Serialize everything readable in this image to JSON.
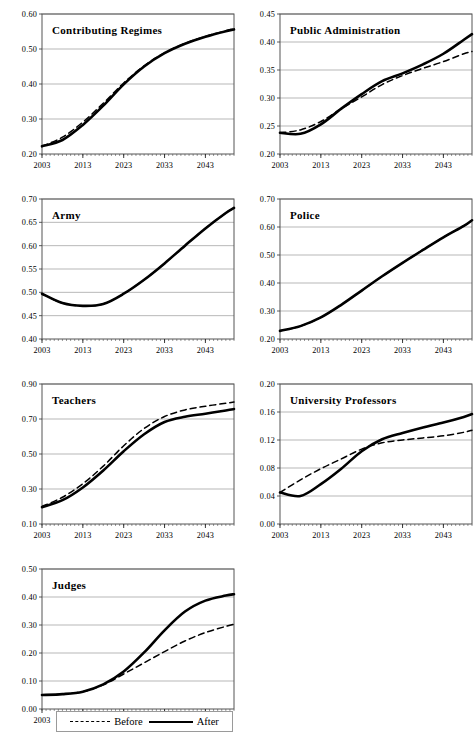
{
  "figure": {
    "xticks": [
      "2003",
      "2013",
      "2023",
      "2033",
      "2043"
    ],
    "x_start": 2003,
    "x_end": 2050
  },
  "legend": {
    "before_label": "Before",
    "after_label": "After",
    "before_style": "dashed",
    "after_style": "solid"
  },
  "chart_data": [
    {
      "type": "line",
      "title": "Contributing Regimes",
      "xlabel": "",
      "ylabel": "",
      "xlim": [
        2003,
        2050
      ],
      "ylim": [
        0.2,
        0.6
      ],
      "yticks": [
        0.2,
        0.3,
        0.4,
        0.5,
        0.6
      ],
      "ytick_labels": [
        "0.20",
        "0.30",
        "0.40",
        "0.50",
        "0.60"
      ],
      "xticks": [
        2003,
        2013,
        2023,
        2033,
        2043
      ],
      "grid": true,
      "legend_position": "figure-bottom",
      "x": [
        2003,
        2008,
        2013,
        2018,
        2023,
        2028,
        2033,
        2038,
        2043,
        2048,
        2050
      ],
      "series": [
        {
          "name": "Before",
          "style": "dashed",
          "values": [
            0.222,
            0.248,
            0.291,
            0.345,
            0.403,
            0.452,
            0.489,
            0.516,
            0.536,
            0.552,
            0.557
          ]
        },
        {
          "name": "After",
          "style": "solid",
          "values": [
            0.222,
            0.24,
            0.283,
            0.338,
            0.399,
            0.45,
            0.488,
            0.515,
            0.535,
            0.551,
            0.556
          ]
        }
      ]
    },
    {
      "type": "line",
      "title": "Public Administration",
      "xlabel": "",
      "ylabel": "",
      "xlim": [
        2003,
        2050
      ],
      "ylim": [
        0.2,
        0.45
      ],
      "yticks": [
        0.2,
        0.25,
        0.3,
        0.35,
        0.4,
        0.45
      ],
      "ytick_labels": [
        "0.20",
        "0.25",
        "0.30",
        "0.35",
        "0.40",
        "0.45"
      ],
      "xticks": [
        2003,
        2013,
        2023,
        2033,
        2043
      ],
      "grid": true,
      "legend_position": "figure-bottom",
      "x": [
        2003,
        2008,
        2013,
        2018,
        2023,
        2028,
        2033,
        2038,
        2043,
        2048,
        2050
      ],
      "series": [
        {
          "name": "Before",
          "style": "dashed",
          "values": [
            0.238,
            0.243,
            0.258,
            0.281,
            0.302,
            0.324,
            0.34,
            0.353,
            0.365,
            0.379,
            0.383
          ]
        },
        {
          "name": "After",
          "style": "solid",
          "values": [
            0.238,
            0.236,
            0.253,
            0.281,
            0.307,
            0.33,
            0.344,
            0.36,
            0.379,
            0.404,
            0.414
          ]
        }
      ]
    },
    {
      "type": "line",
      "title": "Army",
      "xlabel": "",
      "ylabel": "",
      "xlim": [
        2003,
        2050
      ],
      "ylim": [
        0.4,
        0.7
      ],
      "yticks": [
        0.4,
        0.45,
        0.5,
        0.55,
        0.6,
        0.65,
        0.7
      ],
      "ytick_labels": [
        "0.40",
        "0.45",
        "0.50",
        "0.55",
        "0.60",
        "0.65",
        "0.70"
      ],
      "xticks": [
        2003,
        2013,
        2023,
        2033,
        2043
      ],
      "grid": true,
      "legend_position": "figure-bottom",
      "x": [
        2003,
        2008,
        2013,
        2018,
        2023,
        2028,
        2033,
        2038,
        2043,
        2048,
        2050
      ],
      "series": [
        {
          "name": "Before",
          "style": "dashed",
          "values": [
            0.497,
            0.477,
            0.471,
            0.475,
            0.497,
            0.527,
            0.562,
            0.6,
            0.637,
            0.67,
            0.681
          ]
        },
        {
          "name": "After",
          "style": "solid",
          "values": [
            0.497,
            0.477,
            0.471,
            0.475,
            0.497,
            0.527,
            0.562,
            0.6,
            0.637,
            0.67,
            0.681
          ]
        }
      ]
    },
    {
      "type": "line",
      "title": "Police",
      "xlabel": "",
      "ylabel": "",
      "xlim": [
        2003,
        2050
      ],
      "ylim": [
        0.2,
        0.7
      ],
      "yticks": [
        0.2,
        0.3,
        0.4,
        0.5,
        0.6,
        0.7
      ],
      "ytick_labels": [
        "0.20",
        "0.30",
        "0.40",
        "0.50",
        "0.60",
        "0.70"
      ],
      "xticks": [
        2003,
        2013,
        2023,
        2033,
        2043
      ],
      "grid": true,
      "legend_position": "figure-bottom",
      "x": [
        2003,
        2008,
        2013,
        2018,
        2023,
        2028,
        2033,
        2038,
        2043,
        2048,
        2050
      ],
      "series": [
        {
          "name": "Before",
          "style": "dashed",
          "values": [
            0.229,
            0.246,
            0.277,
            0.322,
            0.373,
            0.424,
            0.472,
            0.518,
            0.563,
            0.604,
            0.624
          ]
        },
        {
          "name": "After",
          "style": "solid",
          "values": [
            0.229,
            0.246,
            0.277,
            0.322,
            0.373,
            0.424,
            0.472,
            0.518,
            0.563,
            0.604,
            0.624
          ]
        }
      ]
    },
    {
      "type": "line",
      "title": "Teachers",
      "xlabel": "",
      "ylabel": "",
      "xlim": [
        2003,
        2050
      ],
      "ylim": [
        0.1,
        0.9
      ],
      "yticks": [
        0.1,
        0.3,
        0.5,
        0.7,
        0.9
      ],
      "ytick_labels": [
        "0.10",
        "0.30",
        "0.50",
        "0.70",
        "0.90"
      ],
      "xticks": [
        2003,
        2013,
        2023,
        2033,
        2043
      ],
      "grid": true,
      "legend_position": "figure-bottom",
      "x": [
        2003,
        2008,
        2013,
        2018,
        2023,
        2028,
        2033,
        2038,
        2043,
        2048,
        2050
      ],
      "series": [
        {
          "name": "Before",
          "style": "dashed",
          "values": [
            0.2,
            0.253,
            0.33,
            0.431,
            0.547,
            0.646,
            0.714,
            0.752,
            0.773,
            0.79,
            0.797
          ]
        },
        {
          "name": "After",
          "style": "solid",
          "values": [
            0.196,
            0.236,
            0.309,
            0.406,
            0.516,
            0.613,
            0.683,
            0.713,
            0.73,
            0.749,
            0.757
          ]
        }
      ]
    },
    {
      "type": "line",
      "title": "University Professors",
      "xlabel": "",
      "ylabel": "",
      "xlim": [
        2003,
        2050
      ],
      "ylim": [
        0.0,
        0.2
      ],
      "yticks": [
        0.0,
        0.04,
        0.08,
        0.12,
        0.16,
        0.2
      ],
      "ytick_labels": [
        "0.00",
        "0.04",
        "0.08",
        "0.12",
        "0.16",
        "0.20"
      ],
      "xticks": [
        2003,
        2013,
        2023,
        2033,
        2043
      ],
      "grid": true,
      "legend_position": "figure-bottom",
      "x": [
        2003,
        2008,
        2013,
        2018,
        2023,
        2028,
        2033,
        2038,
        2043,
        2048,
        2050
      ],
      "series": [
        {
          "name": "Before",
          "style": "dashed",
          "values": [
            0.045,
            0.063,
            0.079,
            0.093,
            0.107,
            0.116,
            0.12,
            0.123,
            0.126,
            0.131,
            0.134
          ]
        },
        {
          "name": "After",
          "style": "solid",
          "values": [
            0.045,
            0.04,
            0.057,
            0.079,
            0.104,
            0.121,
            0.13,
            0.138,
            0.145,
            0.153,
            0.157
          ]
        }
      ]
    },
    {
      "type": "line",
      "title": "Judges",
      "xlabel": "",
      "ylabel": "",
      "xlim": [
        2003,
        2050
      ],
      "ylim": [
        0.0,
        0.5
      ],
      "yticks": [
        0.0,
        0.1,
        0.2,
        0.3,
        0.4,
        0.5
      ],
      "ytick_labels": [
        "0.00",
        "0.10",
        "0.20",
        "0.30",
        "0.40",
        "0.50"
      ],
      "xticks": [
        2003,
        2013,
        2023,
        2033,
        2043
      ],
      "grid": true,
      "legend_position": "figure-bottom",
      "x": [
        2003,
        2008,
        2013,
        2018,
        2023,
        2028,
        2033,
        2038,
        2043,
        2048,
        2050
      ],
      "series": [
        {
          "name": "Before",
          "style": "dashed",
          "values": [
            0.05,
            0.053,
            0.062,
            0.086,
            0.125,
            0.165,
            0.205,
            0.243,
            0.273,
            0.295,
            0.303
          ]
        },
        {
          "name": "After",
          "style": "solid",
          "values": [
            0.05,
            0.053,
            0.062,
            0.088,
            0.134,
            0.202,
            0.281,
            0.348,
            0.387,
            0.405,
            0.41
          ]
        }
      ]
    }
  ]
}
